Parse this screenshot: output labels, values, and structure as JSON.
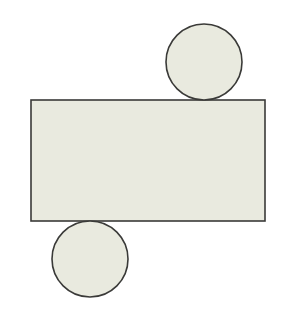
{
  "diagram": {
    "type": "cylinder-net",
    "colors": {
      "background": "#ffffff",
      "fill": "#e9eadf",
      "stroke": "#3a3a38"
    },
    "shapes": {
      "top_circle": {
        "cx": 204,
        "cy": 62,
        "r": 38
      },
      "rectangle": {
        "x": 31,
        "y": 100,
        "width": 234,
        "height": 121
      },
      "bottom_circle": {
        "cx": 90,
        "cy": 259,
        "r": 38
      }
    }
  }
}
